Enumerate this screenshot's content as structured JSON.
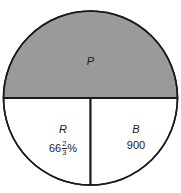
{
  "figure": {
    "type": "circle-diagram",
    "background_color": "#ffffff",
    "stroke_color": "#1a1a1a",
    "shaded_fill_color": "#9a9a9a",
    "unshaded_fill_color": "#ffffff",
    "geometry": {
      "center_x": 90.5,
      "center_y": 98,
      "radius": 87,
      "horizontal_diameter_y": 98,
      "vertical_radius_x": 90.5,
      "stroke_width": 1.6
    },
    "regions": [
      {
        "id": "p",
        "name": "upper-semicircle",
        "label": "P",
        "value": "",
        "shaded": true
      },
      {
        "id": "r",
        "name": "lower-left-quarter",
        "label": "R",
        "value": "66⅔%",
        "value_whole": "66",
        "value_fraction_numerator": "2",
        "value_fraction_denominator": "3",
        "value_suffix": "%",
        "shaded": false
      },
      {
        "id": "b",
        "name": "lower-right-quarter",
        "label": "B",
        "value": "900",
        "shaded": false
      }
    ]
  }
}
